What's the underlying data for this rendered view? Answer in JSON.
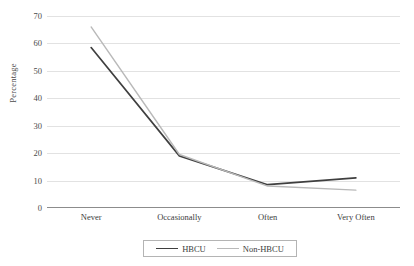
{
  "chart_data": {
    "type": "line",
    "title": "",
    "xlabel": "",
    "ylabel": "Percentage",
    "categories": [
      "Never",
      "Occasionally",
      "Often",
      "Very Often"
    ],
    "ylim": [
      0,
      70
    ],
    "ytick_step": 10,
    "yticks": [
      0,
      10,
      20,
      30,
      40,
      50,
      60,
      70
    ],
    "ytick_labels": [
      "0",
      "10",
      "20",
      "30",
      "40",
      "50",
      "60",
      "70"
    ],
    "grid": true,
    "legend_position": "bottom",
    "series": [
      {
        "name": "HBCU",
        "color": "#3f3f3f",
        "values": [
          58.5,
          19.0,
          8.5,
          11.0
        ]
      },
      {
        "name": "Non-HBCU",
        "color": "#b9b9b9",
        "values": [
          66.0,
          19.5,
          8.0,
          6.5
        ]
      }
    ]
  },
  "axis": {
    "y_title": "Percentage"
  },
  "legend": {
    "entries": [
      {
        "label": "HBCU"
      },
      {
        "label": "Non-HBCU"
      }
    ]
  }
}
